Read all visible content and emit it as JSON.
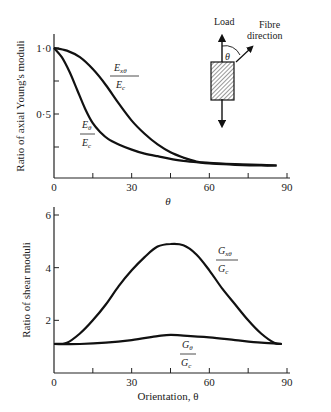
{
  "chart_data": [
    {
      "type": "line",
      "title": "",
      "xlabel": "θ",
      "ylabel": "Ratio of axial Young's moduli",
      "xlim": [
        0,
        90
      ],
      "ylim": [
        0,
        1.0
      ],
      "x_ticks": [
        "0",
        "30",
        "60",
        "90"
      ],
      "x_minor_ticks": [
        15,
        45,
        75
      ],
      "y_ticks": [
        "0·5",
        "1·0"
      ],
      "y_minor_ticks": [
        0.25,
        0.75
      ],
      "grid": false,
      "series": [
        {
          "name": "E_xθ / E_c",
          "label_num": "E",
          "label_num_sub": "xθ",
          "label_den": "E",
          "label_den_sub": "c",
          "x": [
            0,
            5,
            10,
            15,
            20,
            25,
            30,
            35,
            40,
            45,
            50,
            55,
            60,
            70,
            80,
            86
          ],
          "values": [
            1.0,
            0.98,
            0.93,
            0.84,
            0.72,
            0.58,
            0.45,
            0.35,
            0.27,
            0.21,
            0.17,
            0.14,
            0.13,
            0.12,
            0.115,
            0.11
          ]
        },
        {
          "name": "E_θ / E_c",
          "label_num": "E",
          "label_num_sub": "θ",
          "label_den": "E",
          "label_den_sub": "c",
          "x": [
            0,
            3,
            6,
            9,
            12,
            15,
            18,
            21,
            25,
            30,
            35,
            40,
            45,
            50,
            55,
            60,
            70,
            80,
            86
          ],
          "values": [
            1.0,
            0.93,
            0.82,
            0.68,
            0.54,
            0.43,
            0.36,
            0.31,
            0.27,
            0.23,
            0.2,
            0.18,
            0.16,
            0.145,
            0.135,
            0.125,
            0.115,
            0.11,
            0.11
          ]
        }
      ],
      "inset_diagram": {
        "load_label": "Load",
        "fibre_label_line1": "Fibre",
        "fibre_label_line2": "direction",
        "angle_label": "θ"
      }
    },
    {
      "type": "line",
      "title": "",
      "xlabel": "Orientation, θ",
      "ylabel": "Ratio of shear moduli",
      "xlim": [
        0,
        90
      ],
      "ylim": [
        0,
        6
      ],
      "x_ticks": [
        "0",
        "30",
        "60",
        "90"
      ],
      "x_minor_ticks": [
        15,
        45,
        75
      ],
      "y_ticks": [
        "2",
        "4",
        "6"
      ],
      "grid": false,
      "series": [
        {
          "name": "G_xθ / G_c",
          "label_num": "G",
          "label_num_sub": "xθ",
          "label_den": "G",
          "label_den_sub": "c",
          "x": [
            0,
            5,
            10,
            15,
            20,
            25,
            30,
            35,
            40,
            45,
            50,
            55,
            60,
            65,
            70,
            75,
            80,
            85,
            88
          ],
          "values": [
            1.1,
            1.15,
            1.5,
            2.0,
            2.6,
            3.3,
            3.9,
            4.4,
            4.8,
            4.9,
            4.85,
            4.5,
            3.9,
            3.2,
            2.6,
            2.0,
            1.5,
            1.15,
            1.1
          ]
        },
        {
          "name": "G_θ / G_c",
          "label_num": "G",
          "label_num_sub": "θ",
          "label_den": "G",
          "label_den_sub": "c",
          "x": [
            0,
            10,
            20,
            30,
            40,
            45,
            50,
            60,
            70,
            80,
            88
          ],
          "values": [
            1.1,
            1.1,
            1.15,
            1.25,
            1.4,
            1.45,
            1.42,
            1.35,
            1.25,
            1.15,
            1.1
          ]
        }
      ]
    }
  ]
}
